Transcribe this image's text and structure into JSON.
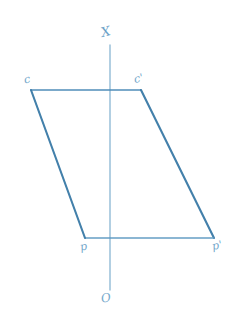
{
  "figure": {
    "background_color": "#ffffff",
    "stroke_color": "#3d7ca8",
    "axis_color": "#8cb8d4",
    "label_color": "#5e9ac4"
  },
  "axis": {
    "name": "vertical-axis",
    "x": 110,
    "y_top": 45,
    "y_bottom": 290,
    "top_label": "X",
    "bottom_label": "O"
  },
  "shape": {
    "type": "parallelogram",
    "vertices": [
      {
        "label": "c",
        "x": 31,
        "y": 90
      },
      {
        "label": "c'",
        "x": 141,
        "y": 90
      },
      {
        "label": "p'",
        "x": 214,
        "y": 238
      },
      {
        "label": "p",
        "x": 85,
        "y": 238
      }
    ],
    "edges": [
      {
        "name": "top-edge",
        "from": "c",
        "to": "c'"
      },
      {
        "name": "right-edge",
        "from": "c'",
        "to": "p'"
      },
      {
        "name": "bottom-edge",
        "from": "p'",
        "to": "p"
      },
      {
        "name": "left-edge",
        "from": "p",
        "to": "c"
      }
    ]
  },
  "labels": {
    "axis_x": "X",
    "axis_o": "O",
    "vertex_c": "c",
    "vertex_c_prime": "c'",
    "vertex_p": "p",
    "vertex_p_prime": "p'"
  }
}
